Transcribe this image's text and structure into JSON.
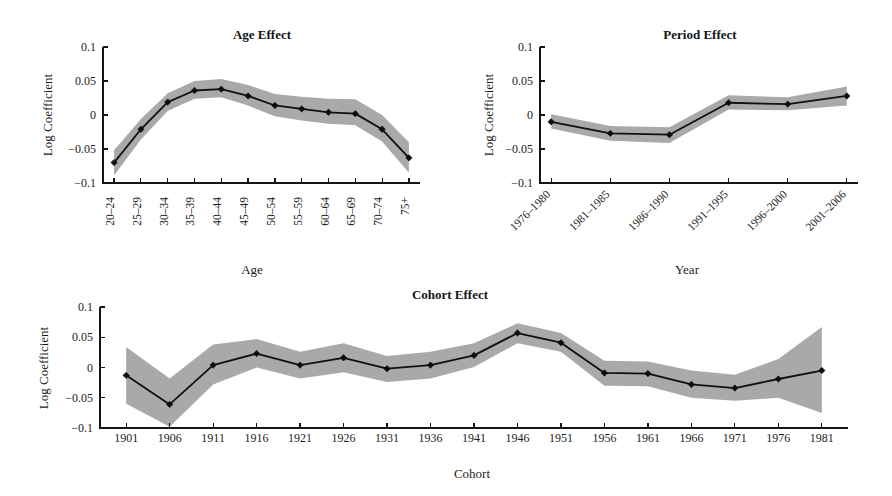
{
  "figure": {
    "background": "#ffffff",
    "ink_color": "#141414",
    "band_color": "#a9a9a9",
    "width": 892,
    "height": 496
  },
  "chart_data": [
    {
      "id": "age-effect",
      "type": "line",
      "title": "Age Effect",
      "xlabel": "Age",
      "ylabel": "Log Coefficient",
      "ylim": [
        -0.1,
        0.1
      ],
      "yticks": [
        -0.1,
        -0.05,
        0,
        0.05,
        0.1
      ],
      "ytick_labels": [
        "−0.1",
        "−0.05",
        "0",
        "0.05",
        "0.1"
      ],
      "grid": false,
      "legend": "none",
      "xtick_rotation": 90,
      "categories": [
        "20–24",
        "25–29",
        "30–34",
        "35–39",
        "40–44",
        "45–49",
        "50–54",
        "55–59",
        "60–64",
        "65–69",
        "70–74",
        "75+"
      ],
      "values": [
        -0.07,
        -0.021,
        0.019,
        0.036,
        0.038,
        0.028,
        0.014,
        0.009,
        0.004,
        0.002,
        -0.021,
        -0.063
      ],
      "ci_lower": [
        -0.089,
        -0.036,
        0.006,
        0.024,
        0.026,
        0.014,
        -0.002,
        -0.008,
        -0.013,
        -0.015,
        -0.039,
        -0.085
      ],
      "ci_upper": [
        -0.052,
        -0.006,
        0.032,
        0.05,
        0.053,
        0.044,
        0.031,
        0.027,
        0.024,
        0.023,
        0.0,
        -0.04
      ]
    },
    {
      "id": "period-effect",
      "type": "line",
      "title": "Period Effect",
      "xlabel": "Year",
      "ylabel": "Log Coefficient",
      "ylim": [
        -0.1,
        0.1
      ],
      "yticks": [
        -0.1,
        -0.05,
        0,
        0.05,
        0.1
      ],
      "ytick_labels": [
        "−0.1",
        "−0.05",
        "0",
        "0.05",
        "0.1"
      ],
      "grid": false,
      "legend": "none",
      "xtick_rotation": 30,
      "categories": [
        "1976–1980",
        "1981–1985",
        "1986–1990",
        "1991–1995",
        "1996–2000",
        "2001–2006"
      ],
      "values": [
        -0.01,
        -0.027,
        -0.029,
        0.018,
        0.016,
        0.028
      ],
      "ci_lower": [
        -0.02,
        -0.038,
        -0.041,
        0.008,
        0.007,
        0.014
      ],
      "ci_upper": [
        0.001,
        -0.016,
        -0.018,
        0.029,
        0.026,
        0.042
      ]
    },
    {
      "id": "cohort-effect",
      "type": "line",
      "title": "Cohort Effect",
      "xlabel": "Cohort",
      "ylabel": "Log Coefficient",
      "ylim": [
        -0.1,
        0.1
      ],
      "yticks": [
        -0.1,
        -0.05,
        0,
        0.05,
        0.1
      ],
      "ytick_labels": [
        "−0.1",
        "−0.05",
        "0",
        "0.05",
        "0.1"
      ],
      "grid": false,
      "legend": "none",
      "xtick_rotation": 0,
      "categories": [
        "1901",
        "1906",
        "1911",
        "1916",
        "1921",
        "1926",
        "1931",
        "1936",
        "1941",
        "1946",
        "1951",
        "1956",
        "1961",
        "1966",
        "1971",
        "1976",
        "1981"
      ],
      "values": [
        -0.013,
        -0.061,
        0.004,
        0.023,
        0.004,
        0.016,
        -0.002,
        0.004,
        0.02,
        0.057,
        0.041,
        -0.009,
        -0.01,
        -0.028,
        -0.034,
        -0.019,
        -0.005
      ],
      "ci_lower": [
        -0.06,
        -0.098,
        -0.028,
        0.0,
        -0.018,
        -0.008,
        -0.024,
        -0.018,
        0.001,
        0.04,
        0.026,
        -0.03,
        -0.031,
        -0.05,
        -0.055,
        -0.05,
        -0.075
      ],
      "ci_upper": [
        0.034,
        -0.018,
        0.038,
        0.047,
        0.026,
        0.04,
        0.019,
        0.026,
        0.04,
        0.073,
        0.057,
        0.011,
        0.01,
        -0.005,
        -0.012,
        0.014,
        0.067
      ]
    }
  ]
}
